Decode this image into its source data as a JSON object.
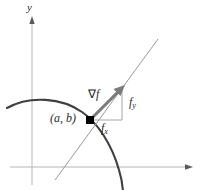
{
  "figure": {
    "kind": "math-diagram",
    "background_color": "#ffffff",
    "axes": {
      "y_axis_label": "y",
      "axis_color": "#b0b0b0",
      "x_axis_y": 167,
      "y_axis_x": 32
    },
    "labels": {
      "point": "(a, b)",
      "gradient_symbol": "∇",
      "gradient_function": "f",
      "component_y_base": "f",
      "component_y_sub": "y",
      "component_x_base": "f",
      "component_x_sub": "x"
    },
    "colors": {
      "level_curve": "#3f3f3f",
      "tangent_line": "#8f8f8f",
      "gradient_arrow": "#7a7a7a",
      "component_legs": "#9a9a9a",
      "point_marker": "#000000",
      "text": "#2b2b2b"
    },
    "geometry": {
      "point_x": 90,
      "point_y": 120,
      "arrow_tip_x": 124,
      "arrow_tip_y": 86,
      "corner_x": 122,
      "corner_y": 120
    }
  }
}
